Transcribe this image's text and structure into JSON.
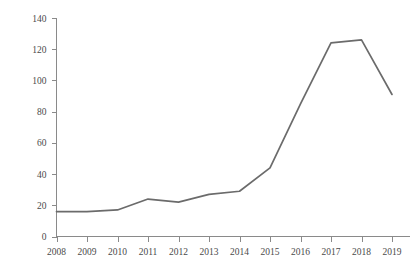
{
  "chart_data": {
    "type": "line",
    "title": "",
    "subtitle": "",
    "xlabel": "",
    "ylabel": "",
    "categories": [
      "2008",
      "2009",
      "2010",
      "2011",
      "2012",
      "2013",
      "2014",
      "2015",
      "2016",
      "2017",
      "2018",
      "2019"
    ],
    "x": [
      2008,
      2009,
      2010,
      2011,
      2012,
      2013,
      2014,
      2015,
      2016,
      2017,
      2018,
      2019
    ],
    "values": [
      16,
      16,
      17,
      24,
      22,
      27,
      29,
      44,
      85,
      124,
      126,
      91
    ],
    "series": [
      {
        "name": "",
        "values": [
          16,
          16,
          17,
          24,
          22,
          27,
          29,
          44,
          85,
          124,
          126,
          91
        ]
      }
    ],
    "ylim": [
      0,
      140
    ],
    "xlim": [
      2008,
      2019
    ],
    "y_ticks": [
      0,
      20,
      40,
      60,
      80,
      100,
      120,
      140
    ],
    "y_tick_labels": [
      "0",
      "20",
      "40",
      "60",
      "80",
      "100",
      "120",
      "140"
    ],
    "x_ticks": [
      2008,
      2009,
      2010,
      2011,
      2012,
      2013,
      2014,
      2015,
      2016,
      2017,
      2018,
      2019
    ],
    "x_tick_labels": [
      "2008",
      "2009",
      "2010",
      "2011",
      "2012",
      "2013",
      "2014",
      "2015",
      "2016",
      "2017",
      "2018",
      "2019"
    ],
    "grid": false,
    "legend": null,
    "legend_position": "none",
    "annotations": [],
    "markers": false,
    "colors": {
      "line": "#6b6b6b",
      "axis": "#8a8a8a",
      "tick_label": "#4a4a4a",
      "background": "#ffffff"
    }
  }
}
